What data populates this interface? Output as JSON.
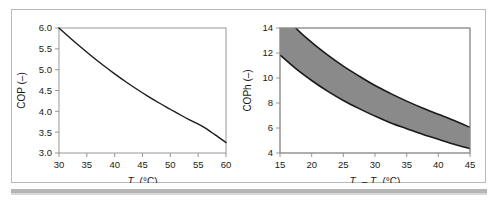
{
  "figure": {
    "background_color": "#ffffff",
    "frame_color": "#b9b9b9",
    "curve_color": "#1a1a1a",
    "band_fill_color": "#8a8a8a",
    "axis_color": "#8c8c8c"
  },
  "chart_data": [
    {
      "type": "line",
      "title": "",
      "subtitle": "",
      "xlabel": "Tc (°C)",
      "xlabel_symbol": "T",
      "xlabel_subscript": "c",
      "xlabel_units": "(°C)",
      "ylabel": "COP (–)",
      "xlim": [
        30,
        60
      ],
      "ylim": [
        3.0,
        6.0
      ],
      "xticks": [
        30,
        35,
        40,
        45,
        50,
        55,
        60
      ],
      "yticks": [
        3.0,
        3.5,
        4.0,
        4.5,
        5.0,
        5.5,
        6.0
      ],
      "xtick_labels": [
        "30",
        "35",
        "40",
        "45",
        "50",
        "55",
        "60"
      ],
      "ytick_labels": [
        "3.0",
        "3.5",
        "4.0",
        "4.5",
        "5.0",
        "5.5",
        "6.0"
      ],
      "grid": false,
      "legend": "none",
      "series": [
        {
          "name": "COP",
          "x": [
            30,
            32,
            34,
            36,
            38,
            40,
            42,
            44,
            46,
            48,
            50,
            52,
            54,
            56,
            58,
            60
          ],
          "values": [
            6.0,
            5.76,
            5.53,
            5.31,
            5.1,
            4.9,
            4.71,
            4.53,
            4.36,
            4.2,
            4.05,
            3.9,
            3.76,
            3.62,
            3.44,
            3.25
          ]
        }
      ]
    },
    {
      "type": "area",
      "title": "",
      "subtitle": "",
      "xlabel": "Tc – Te (°C)",
      "xlabel_symbol_1": "T",
      "xlabel_subscript_1": "c",
      "xlabel_operator": "–",
      "xlabel_symbol_2": "T",
      "xlabel_subscript_2": "e",
      "xlabel_units": "(°C)",
      "ylabel": "COPh (–)",
      "xlim": [
        15,
        45
      ],
      "ylim": [
        4,
        14
      ],
      "xticks": [
        15,
        20,
        25,
        30,
        35,
        40,
        45
      ],
      "yticks": [
        4,
        6,
        8,
        10,
        12,
        14
      ],
      "xtick_labels": [
        "15",
        "20",
        "25",
        "30",
        "35",
        "40",
        "45"
      ],
      "ytick_labels": [
        "4",
        "6",
        "8",
        "10",
        "12",
        "14"
      ],
      "grid": false,
      "legend": "none",
      "series": [
        {
          "name": "upper bound",
          "x": [
            15,
            17.5,
            20,
            22.5,
            25,
            27.5,
            30,
            32.5,
            35,
            37.5,
            40,
            42.5,
            45
          ],
          "values": [
            15.6,
            14.0,
            12.85,
            11.85,
            10.95,
            10.15,
            9.4,
            8.75,
            8.15,
            7.6,
            7.1,
            6.6,
            6.05
          ]
        },
        {
          "name": "lower bound",
          "x": [
            15,
            17.5,
            20,
            22.5,
            25,
            27.5,
            30,
            32.5,
            35,
            37.5,
            40,
            42.5,
            45
          ],
          "values": [
            11.85,
            10.75,
            9.8,
            8.95,
            8.2,
            7.55,
            6.95,
            6.4,
            5.95,
            5.5,
            5.1,
            4.7,
            4.35
          ]
        }
      ]
    }
  ]
}
